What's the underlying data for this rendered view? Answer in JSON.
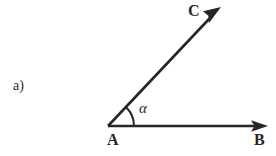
{
  "figure": {
    "item_label": "a)",
    "background_color": "#ffffff",
    "stroke_color": "#262626",
    "width": 276,
    "height": 156,
    "points": {
      "vertex": {
        "name": "A",
        "label": "A",
        "x": 108,
        "y": 126
      },
      "ray_horizontal_end": {
        "name": "B",
        "label": "B",
        "x": 268,
        "y": 126
      },
      "ray_diagonal_end": {
        "name": "C",
        "label": "C",
        "x": 221,
        "y": 7
      }
    },
    "angle": {
      "symbol": "α",
      "label": "α",
      "arc_radius": 26,
      "degrees": 46
    },
    "rays": [
      {
        "name": "ray-AB",
        "from": "A",
        "to": "B",
        "arrow": true
      },
      {
        "name": "ray-AC",
        "from": "A",
        "to": "C",
        "arrow": true
      }
    ]
  }
}
